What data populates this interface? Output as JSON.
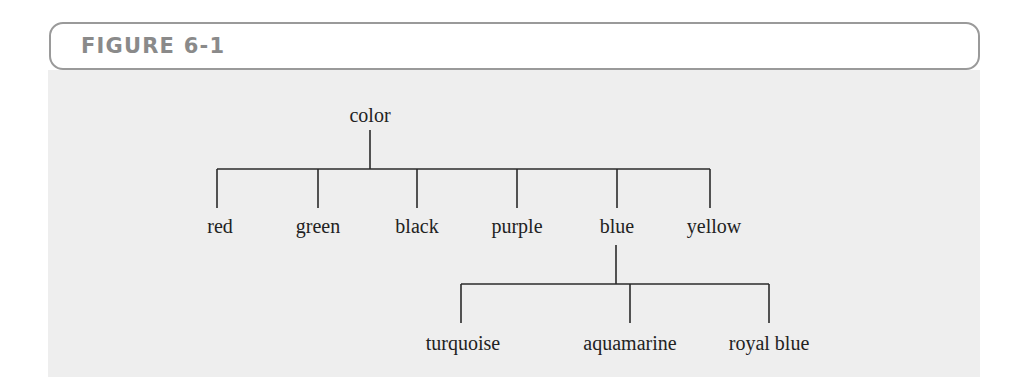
{
  "figure": {
    "label": "FIGURE 6-1"
  },
  "colors": {
    "header_border": "#9a9a9a",
    "header_text": "#8a8a8a",
    "panel_background": "#eeeeee",
    "line": "#2a2a2a",
    "text": "#222222"
  },
  "tree": {
    "root": {
      "label": "color",
      "children": [
        {
          "label": "red"
        },
        {
          "label": "green"
        },
        {
          "label": "black"
        },
        {
          "label": "purple"
        },
        {
          "label": "blue",
          "children": [
            {
              "label": "turquoise"
            },
            {
              "label": "aquamarine"
            },
            {
              "label": "royal blue"
            }
          ]
        },
        {
          "label": "yellow"
        }
      ]
    }
  }
}
